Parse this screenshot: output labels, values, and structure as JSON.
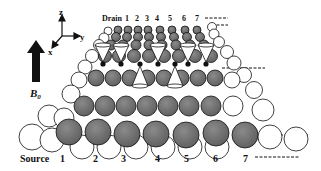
{
  "axes": {
    "z_label": "z",
    "y_label": "y",
    "x_label": "x"
  },
  "field": {
    "label": "B",
    "subscript": "0"
  },
  "drain": {
    "title": "Drain",
    "labels": [
      "1",
      "2",
      "3",
      "4",
      "5",
      "6",
      "7"
    ]
  },
  "source": {
    "title": "Source",
    "labels": [
      "1",
      "2",
      "3",
      "4",
      "5",
      "6",
      "7"
    ]
  },
  "colors": {
    "dark_sphere": "#6e6e6e",
    "light_sphere": "#ffffff",
    "outline": "#111111",
    "cone": "#ffffff",
    "dot": "#111111"
  }
}
